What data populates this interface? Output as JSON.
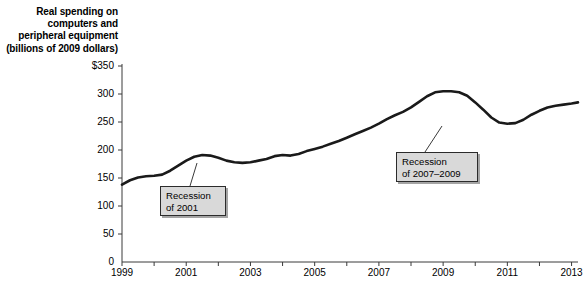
{
  "chart_data": {
    "type": "line",
    "title": "Real spending on computers and peripheral equipment (billions of 2009 dollars)",
    "title_lines": [
      "Real spending on",
      "computers and",
      "peripheral equipment",
      "(billions of 2009 dollars)"
    ],
    "xlabel": "",
    "ylabel": "",
    "xlim": [
      1999,
      2013.2
    ],
    "ylim": [
      0,
      350
    ],
    "grid": false,
    "legend": "none",
    "y_ticks": [
      0,
      50,
      100,
      150,
      200,
      250,
      300,
      350
    ],
    "y_tick_labels": [
      "0",
      "50",
      "100",
      "150",
      "200",
      "250",
      "300",
      "$350"
    ],
    "x_ticks": [
      1999,
      2000,
      2001,
      2002,
      2003,
      2004,
      2005,
      2006,
      2007,
      2008,
      2009,
      2010,
      2011,
      2012,
      2013
    ],
    "x_tick_labels": [
      "1999",
      "",
      "2001",
      "",
      "2003",
      "",
      "2005",
      "",
      "2007",
      "",
      "2009",
      "",
      "2011",
      "",
      "2013"
    ],
    "line_color": "#1a1a1a",
    "line_width": 2.6,
    "series": [
      {
        "name": "Real spending on computers and peripheral equipment",
        "x": [
          1999.0,
          1999.25,
          1999.5,
          1999.75,
          2000.0,
          2000.25,
          2000.5,
          2000.75,
          2001.0,
          2001.25,
          2001.5,
          2001.75,
          2002.0,
          2002.25,
          2002.5,
          2002.75,
          2003.0,
          2003.25,
          2003.5,
          2003.75,
          2004.0,
          2004.25,
          2004.5,
          2004.75,
          2005.0,
          2005.25,
          2005.5,
          2005.75,
          2006.0,
          2006.25,
          2006.5,
          2006.75,
          2007.0,
          2007.25,
          2007.5,
          2007.75,
          2008.0,
          2008.25,
          2008.5,
          2008.75,
          2009.0,
          2009.25,
          2009.5,
          2009.75,
          2010.0,
          2010.25,
          2010.5,
          2010.75,
          2011.0,
          2011.25,
          2011.5,
          2011.75,
          2012.0,
          2012.25,
          2012.5,
          2012.75,
          2013.0,
          2013.2
        ],
        "values": [
          138,
          146,
          151,
          153,
          154,
          156,
          163,
          172,
          181,
          188,
          191,
          190,
          186,
          181,
          178,
          177,
          178,
          181,
          184,
          189,
          191,
          190,
          193,
          198,
          202,
          206,
          211,
          216,
          222,
          228,
          234,
          240,
          247,
          255,
          262,
          268,
          276,
          286,
          296,
          303,
          305,
          305,
          303,
          297,
          285,
          272,
          258,
          249,
          247,
          248,
          254,
          263,
          270,
          276,
          279,
          281,
          283,
          285
        ]
      }
    ],
    "annotations": [
      {
        "name": "recession-2001",
        "lines": [
          "Recession",
          "of 2001"
        ],
        "box_x": 160,
        "box_y": 186,
        "box_w": 66,
        "box_h": 30,
        "leader_from_x": 190,
        "leader_from_y": 186,
        "leader_to_x": 197,
        "leader_to_y": 163
      },
      {
        "name": "recession-2007-2009",
        "lines": [
          "Recession",
          "of 2007–2009"
        ],
        "box_x": 396,
        "box_y": 152,
        "box_w": 82,
        "box_h": 30,
        "leader_from_x": 425,
        "leader_from_y": 152,
        "leader_to_x": 442,
        "leader_to_y": 126
      }
    ],
    "axis_geometry": {
      "left": 122,
      "right": 578,
      "top": 66,
      "bottom": 262
    }
  },
  "footer": {
    "fragment": ""
  }
}
